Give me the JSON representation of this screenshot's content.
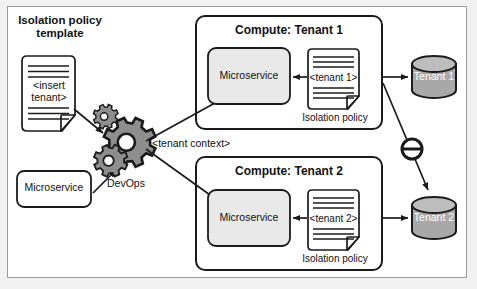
{
  "diagram": {
    "colors": {
      "stroke": "#1b1b1b",
      "frame_border": "#9a9a9a",
      "page_background": "#f2f2f2",
      "canvas_background": "#ffffff",
      "microservice_fill": "#e9e9e9",
      "microservice_fill_plain": "#ffffff",
      "database_fill": "#a8a8a8",
      "database_top_fill": "#bdbdbd",
      "database_text": "#ffffff",
      "gear_fill": "#8e8e8e",
      "document_fill": "#ffffff"
    }
  },
  "left": {
    "template_title_line1": "Isolation policy",
    "template_title_line2": "template",
    "template_doc": {
      "name": "isolation-policy-template-document",
      "text_line1": "<insert",
      "text_line2": "tenant>",
      "rule_lines_above": 2,
      "rule_lines_below": 2
    },
    "microservice_label": "Microservice",
    "devops_label": "DevOps",
    "gear_count": 3
  },
  "edges": {
    "tenant_context_label": "<tenant context>",
    "blocked_symbol": "no-access-icon"
  },
  "tenants": [
    {
      "id": "tenant-1",
      "compute_title": "Compute: Tenant 1",
      "microservice_label": "Microservice",
      "policy_doc_text": "<tenant 1>",
      "policy_caption": "Isolation policy",
      "database_label": "Tenant 1"
    },
    {
      "id": "tenant-2",
      "compute_title": "Compute: Tenant 2",
      "microservice_label": "Microservice",
      "policy_doc_text": "<tenant 2>",
      "policy_caption": "Isolation policy",
      "database_label": "Tenant 2"
    }
  ]
}
